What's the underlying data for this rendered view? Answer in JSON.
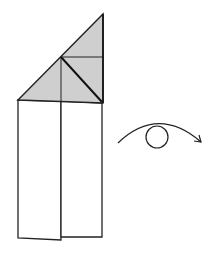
{
  "diagram": {
    "type": "origami-step",
    "colors": {
      "paper_colored": "#cfcfcf",
      "paper_white": "#ffffff",
      "line": "#222222"
    },
    "symbol": {
      "name": "turn-over",
      "description": "Turn the model over"
    }
  }
}
